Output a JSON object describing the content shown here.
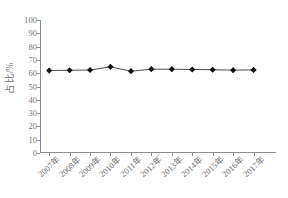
{
  "chart_data": {
    "type": "line",
    "title": "",
    "subtitle": "",
    "xlabel": "",
    "ylabel": "占比/%",
    "categories": [
      "2007年",
      "2008年",
      "2009年",
      "2010年",
      "2011年",
      "2012年",
      "2013年",
      "2014年",
      "2015年",
      "2016年",
      "2017年"
    ],
    "values": [
      62.0,
      62.2,
      62.4,
      64.8,
      61.5,
      63.0,
      63.0,
      62.8,
      62.6,
      62.3,
      62.5
    ],
    "series": [
      {
        "name": "占比",
        "values": [
          62.0,
          62.2,
          62.4,
          64.8,
          61.5,
          63.0,
          63.0,
          62.8,
          62.6,
          62.3,
          62.5
        ]
      }
    ],
    "ylim": [
      0,
      100
    ],
    "y_ticks": [
      0,
      10,
      20,
      30,
      40,
      50,
      60,
      70,
      80,
      90,
      100
    ],
    "y_tick_labels": [
      "0",
      "10",
      "20",
      "30",
      "40",
      "50",
      "60",
      "70",
      "80",
      "90",
      "100"
    ],
    "grid": false,
    "legend": false,
    "legend_position": "none",
    "marker": "diamond",
    "marker_color": "#111111",
    "line_color": "#4d4d4d",
    "axis_color": "#8d8d8d",
    "text_color": "#6f6f6f",
    "background_color": "#ffffff",
    "x_tick_rotation": -42,
    "spines": [
      "left",
      "bottom"
    ]
  }
}
